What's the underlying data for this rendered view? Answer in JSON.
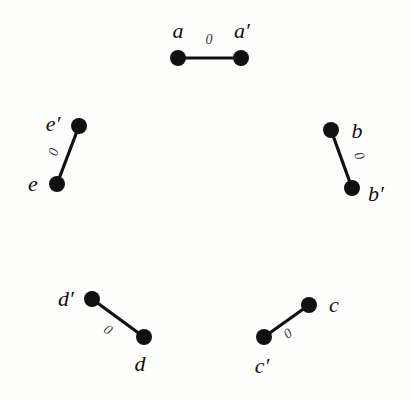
{
  "figure": {
    "background_color": "#fdfdfc",
    "node_color": "#111111",
    "edge_color": "#111111",
    "label_color": "#111111",
    "edge_label_color": "#3a3a3a",
    "node_radius": 8,
    "edge_width": 3.2,
    "width": 410,
    "height": 400
  },
  "edges": [
    {
      "id": "edge-a",
      "label": "0",
      "label_x": 209,
      "label_y": 40,
      "label_rotation": 0,
      "endpoints": [
        {
          "id": "a",
          "label": "a",
          "x": 178,
          "y": 58,
          "label_x": 178,
          "label_y": 31
        },
        {
          "id": "a-prime",
          "label": "a′",
          "x": 241,
          "y": 58,
          "label_x": 242,
          "label_y": 31
        }
      ]
    },
    {
      "id": "edge-b",
      "label": "0",
      "label_x": 359,
      "label_y": 156,
      "label_rotation": 70,
      "endpoints": [
        {
          "id": "b",
          "label": "b",
          "x": 331,
          "y": 130,
          "label_x": 357,
          "label_y": 131
        },
        {
          "id": "b-prime",
          "label": "b′",
          "x": 352,
          "y": 188,
          "label_x": 376,
          "label_y": 194
        }
      ]
    },
    {
      "id": "edge-c",
      "label": "0",
      "label_x": 288,
      "label_y": 334,
      "label_rotation": -35,
      "endpoints": [
        {
          "id": "c",
          "label": "c",
          "x": 309,
          "y": 305,
          "label_x": 334,
          "label_y": 305
        },
        {
          "id": "c-prime",
          "label": "c′",
          "x": 264,
          "y": 337,
          "label_x": 262,
          "label_y": 366
        }
      ]
    },
    {
      "id": "edge-d",
      "label": "0",
      "label_x": 108,
      "label_y": 330,
      "label_rotation": 35,
      "endpoints": [
        {
          "id": "d-prime",
          "label": "d′",
          "x": 92,
          "y": 299,
          "label_x": 66,
          "label_y": 299
        },
        {
          "id": "d",
          "label": "d",
          "x": 144,
          "y": 337,
          "label_x": 140,
          "label_y": 364
        }
      ]
    },
    {
      "id": "edge-e",
      "label": "0",
      "label_x": 54,
      "label_y": 152,
      "label_rotation": -70,
      "endpoints": [
        {
          "id": "e-prime",
          "label": "e′",
          "x": 79,
          "y": 126,
          "label_x": 53,
          "label_y": 124
        },
        {
          "id": "e",
          "label": "e",
          "x": 57,
          "y": 184,
          "label_x": 33,
          "label_y": 184
        }
      ]
    }
  ]
}
